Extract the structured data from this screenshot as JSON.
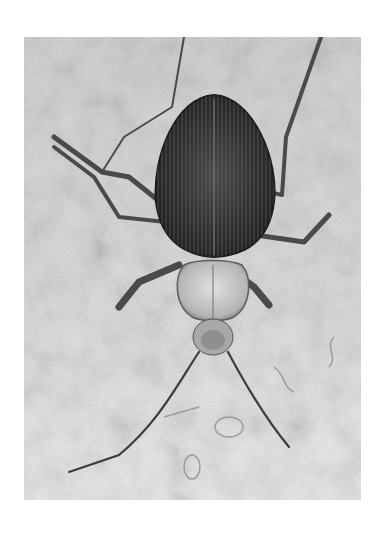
{
  "image": {
    "subject": "Beetle (top-down view) on textured surface",
    "style": "grayscale photograph",
    "colors": {
      "page_background": "#ffffff",
      "surface_light": "#e8e8e8",
      "surface_mid": "#c9c9c9",
      "body_dark": "#2e2e2e",
      "legs": "#4a4a4a"
    },
    "parts": [
      "elytra",
      "pronotum",
      "head",
      "antennae",
      "legs"
    ]
  }
}
